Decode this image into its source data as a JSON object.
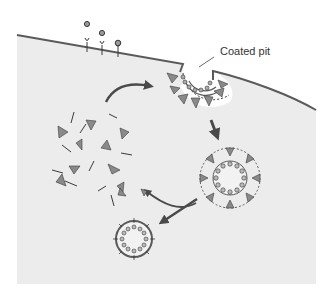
{
  "diagram": {
    "type": "process-diagram",
    "labels": {
      "coated_pit": "Coated pit"
    },
    "colors": {
      "background": "#ffffff",
      "cytoplasm": "#ececec",
      "membrane": "#5a5a5a",
      "coat_triangle": "#8a8a8a",
      "outline": "#3a3a3a",
      "arrow": "#4a4a4a",
      "ligand": "#9a9a9a"
    },
    "elements": [
      {
        "name": "plasma-membrane",
        "description": "curved cell membrane with an invagination"
      },
      {
        "name": "surface-receptors",
        "count": 3,
        "description": "Y-shaped receptors with ligands above and one bound"
      },
      {
        "name": "coated-pit",
        "description": "invaginated membrane with clathrin triskelion coat"
      },
      {
        "name": "coated-vesicle",
        "description": "fully enclosed vesicle with clathrin coat"
      },
      {
        "name": "uncoated-vesicle",
        "description": "small vesicle after coat release"
      },
      {
        "name": "free-clathrin-pool",
        "description": "scattered triangles and rods representing disassembled coat"
      }
    ],
    "arrows": [
      {
        "from": "free-clathrin-pool",
        "to": "coated-pit"
      },
      {
        "from": "coated-pit",
        "to": "coated-vesicle"
      },
      {
        "from": "coated-vesicle",
        "to": "free-clathrin-pool"
      },
      {
        "from": "coated-vesicle",
        "to": "uncoated-vesicle"
      }
    ]
  }
}
